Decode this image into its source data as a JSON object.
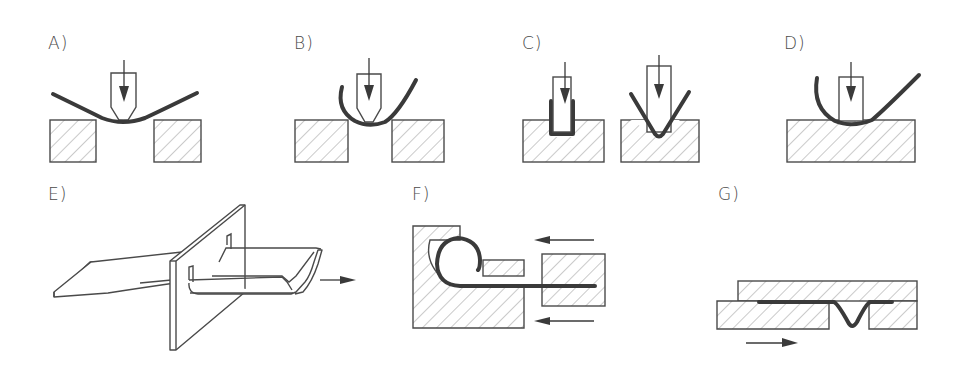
{
  "figure": {
    "panels": [
      {
        "id": "A",
        "label": "A)",
        "name": "free bending (three-point, wide gap)"
      },
      {
        "id": "B",
        "label": "B)",
        "name": "free bending (narrow gap, deep)"
      },
      {
        "id": "C",
        "label": "C)",
        "name": "die bending (U-die and V-die)"
      },
      {
        "id": "D",
        "label": "D)",
        "name": "bending over a single die edge"
      },
      {
        "id": "E",
        "label": "E)",
        "name": "roll / draw forming through a plate"
      },
      {
        "id": "F",
        "label": "F)",
        "name": "curling (edge rolling)"
      },
      {
        "id": "G",
        "label": "G)",
        "name": "slide bending (bead forming)"
      }
    ],
    "colors": {
      "ink": "#4a4a4a",
      "sheet": "#3a3a3a",
      "background": "#ffffff"
    }
  }
}
